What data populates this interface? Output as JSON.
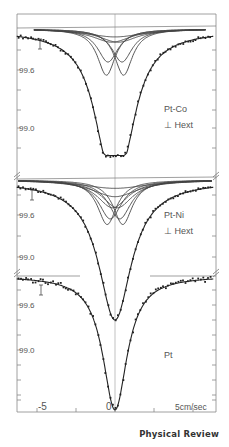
{
  "chart_data": [
    {
      "type": "scatter",
      "title": "Pt-Co",
      "annotation": [
        "Pt-Co",
        "⊥ Hext"
      ],
      "ylabel": "Transmission (%)",
      "yticks": [
        "99.6",
        "99.0"
      ],
      "xlim": [
        -6.5,
        6.5
      ],
      "ylim": [
        98.7,
        100.05
      ],
      "fit_minimum": 98.75,
      "baseline": 100.0,
      "subspectra": "multiple Lorentzian components (four shallow pairs near 0, deeper pair at ±0.6 cm/sec)",
      "x": [
        -6,
        -5,
        -4,
        -3,
        -2.5,
        -2,
        -1.5,
        -1.2,
        -1,
        -0.8,
        -0.5,
        0,
        0.5,
        0.8,
        1,
        1.2,
        1.5,
        2,
        2.5,
        3,
        4,
        5,
        6
      ],
      "values": [
        99.97,
        99.92,
        99.85,
        99.75,
        99.66,
        99.52,
        99.25,
        99.0,
        98.85,
        98.78,
        98.76,
        98.78,
        98.76,
        98.78,
        98.85,
        99.0,
        99.25,
        99.52,
        99.66,
        99.75,
        99.85,
        99.92,
        99.97
      ]
    },
    {
      "type": "scatter",
      "title": "Pt-Ni",
      "annotation": [
        "Pt-Ni",
        "⊥ Hext"
      ],
      "ylabel": "Transmission (%)",
      "yticks": [
        "99.6",
        "99.0"
      ],
      "xlim": [
        -6.5,
        6.5
      ],
      "ylim": [
        98.8,
        100.05
      ],
      "fit_minimum": 98.85,
      "baseline": 100.0,
      "subspectra": "multiple Lorentzian components converging near 0 cm/sec",
      "x": [
        -6,
        -5,
        -4,
        -3,
        -2.5,
        -2,
        -1.5,
        -1.2,
        -1,
        -0.5,
        -0.2,
        0,
        0.2,
        0.5,
        1,
        1.2,
        1.5,
        2,
        2.5,
        3,
        4,
        5,
        6
      ],
      "values": [
        99.97,
        99.93,
        99.87,
        99.77,
        99.68,
        99.55,
        99.3,
        99.1,
        98.98,
        98.9,
        98.87,
        98.85,
        98.87,
        98.9,
        98.98,
        99.1,
        99.3,
        99.55,
        99.68,
        99.77,
        99.87,
        99.93,
        99.97
      ]
    },
    {
      "type": "scatter",
      "title": "Pt",
      "annotation": [
        "Pt"
      ],
      "ylabel": "Transmission (%)",
      "yticks": [
        "99.6",
        "99.0"
      ],
      "xlim": [
        -6.5,
        6.5
      ],
      "ylim": [
        98.6,
        100.05
      ],
      "fit_minimum": 98.62,
      "baseline": 100.0,
      "x": [
        -6,
        -5,
        -4,
        -3,
        -2,
        -1.5,
        -1,
        -0.7,
        -0.4,
        -0.2,
        0,
        0.2,
        0.4,
        0.7,
        1,
        1.5,
        2,
        3,
        4,
        5,
        6
      ],
      "values": [
        99.95,
        99.9,
        99.83,
        99.72,
        99.5,
        99.3,
        99.0,
        98.82,
        98.68,
        98.63,
        98.62,
        98.63,
        98.68,
        98.82,
        99.0,
        99.3,
        99.5,
        99.72,
        99.83,
        99.9,
        99.95
      ]
    }
  ],
  "axis": {
    "x_ticks": [
      "-5",
      "0",
      "5cm/sec"
    ],
    "xlabel": "cm/sec"
  },
  "credit": "Physical Review"
}
